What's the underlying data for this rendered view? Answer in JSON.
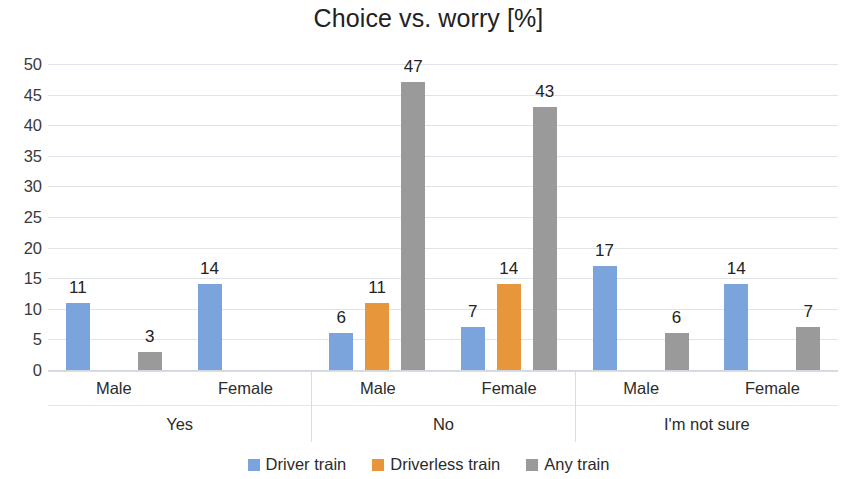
{
  "chart_data": {
    "type": "bar",
    "title": "Choice vs. worry [%]",
    "xlabel": "",
    "ylabel": "",
    "ylim": [
      0,
      50
    ],
    "ytick_step": 5,
    "yticks": [
      50,
      45,
      40,
      35,
      30,
      25,
      20,
      15,
      10,
      5,
      0
    ],
    "grid": true,
    "legend_position": "bottom",
    "group_labels": [
      "Yes",
      "No",
      "I'm not sure"
    ],
    "subgroup_labels": [
      "Male",
      "Female"
    ],
    "categories": [
      "Yes / Male",
      "Yes / Female",
      "No / Male",
      "No / Female",
      "I'm not sure / Male",
      "I'm not sure / Female"
    ],
    "series": [
      {
        "name": "Driver train",
        "color": "#7ba4dd",
        "values": [
          11,
          14,
          6,
          7,
          17,
          14
        ]
      },
      {
        "name": "Driverless train",
        "color": "#e8963c",
        "values": [
          0,
          0,
          11,
          14,
          0,
          0
        ]
      },
      {
        "name": "Any train",
        "color": "#9a9a9a",
        "values": [
          3,
          0,
          47,
          43,
          6,
          7
        ]
      }
    ],
    "groups": [
      {
        "label": "Yes",
        "subgroups": [
          {
            "label": "Male",
            "bars": [
              {
                "series": "Driver train",
                "value": 11,
                "show_label": true
              },
              {
                "series": "Driverless train",
                "value": 0,
                "show_label": false
              },
              {
                "series": "Any train",
                "value": 3,
                "show_label": true
              }
            ]
          },
          {
            "label": "Female",
            "bars": [
              {
                "series": "Driver train",
                "value": 14,
                "show_label": true
              },
              {
                "series": "Driverless train",
                "value": 0,
                "show_label": false
              },
              {
                "series": "Any train",
                "value": 0,
                "show_label": false
              }
            ]
          }
        ]
      },
      {
        "label": "No",
        "subgroups": [
          {
            "label": "Male",
            "bars": [
              {
                "series": "Driver train",
                "value": 6,
                "show_label": true
              },
              {
                "series": "Driverless train",
                "value": 11,
                "show_label": true
              },
              {
                "series": "Any train",
                "value": 47,
                "show_label": true
              }
            ]
          },
          {
            "label": "Female",
            "bars": [
              {
                "series": "Driver train",
                "value": 7,
                "show_label": true
              },
              {
                "series": "Driverless train",
                "value": 14,
                "show_label": true
              },
              {
                "series": "Any train",
                "value": 43,
                "show_label": true
              }
            ]
          }
        ]
      },
      {
        "label": "I'm not sure",
        "subgroups": [
          {
            "label": "Male",
            "bars": [
              {
                "series": "Driver train",
                "value": 17,
                "show_label": true
              },
              {
                "series": "Driverless train",
                "value": 0,
                "show_label": false
              },
              {
                "series": "Any train",
                "value": 6,
                "show_label": true
              }
            ]
          },
          {
            "label": "Female",
            "bars": [
              {
                "series": "Driver train",
                "value": 14,
                "show_label": true
              },
              {
                "series": "Driverless train",
                "value": 0,
                "show_label": false
              },
              {
                "series": "Any train",
                "value": 7,
                "show_label": true
              }
            ]
          }
        ]
      }
    ],
    "legend": [
      {
        "label": "Driver train",
        "color": "#7ba4dd",
        "key": "driver"
      },
      {
        "label": "Driverless train",
        "color": "#e8963c",
        "key": "driverless"
      },
      {
        "label": "Any train",
        "color": "#9a9a9a",
        "key": "any"
      }
    ]
  }
}
